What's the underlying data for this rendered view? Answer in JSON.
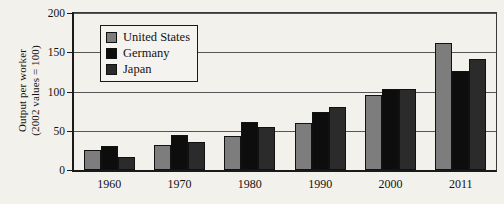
{
  "chart_data": {
    "type": "bar",
    "title": "",
    "xlabel": "",
    "ylabel": "Output per worker (2002 values = 100)",
    "ylabel_line1": "Output per worker",
    "ylabel_line2": "(2002 values = 100)",
    "categories": [
      "1960",
      "1970",
      "1980",
      "1990",
      "2000",
      "2011"
    ],
    "series": [
      {
        "name": "United States",
        "color": "#7d7d7d",
        "values": [
          25,
          32,
          43,
          60,
          96,
          162
        ]
      },
      {
        "name": "Germany",
        "color": "#0d0d0d",
        "values": [
          31,
          44,
          61,
          74,
          103,
          126
        ]
      },
      {
        "name": "Japan",
        "color": "#2b2b2b",
        "values": [
          16,
          36,
          55,
          80,
          103,
          142
        ]
      }
    ],
    "ylim": [
      0,
      200
    ],
    "yticks": [
      0,
      50,
      100,
      150,
      200
    ],
    "ytick_labels": [
      "0",
      "50",
      "100",
      "150",
      "200"
    ],
    "grid": true,
    "legend_position": "upper-left-inside"
  },
  "legend": {
    "entries": [
      {
        "label": "United States",
        "swatch": "#7d7d7d"
      },
      {
        "label": "Germany",
        "swatch": "#0d0d0d"
      },
      {
        "label": "Japan",
        "swatch": "#2b2b2b"
      }
    ]
  }
}
